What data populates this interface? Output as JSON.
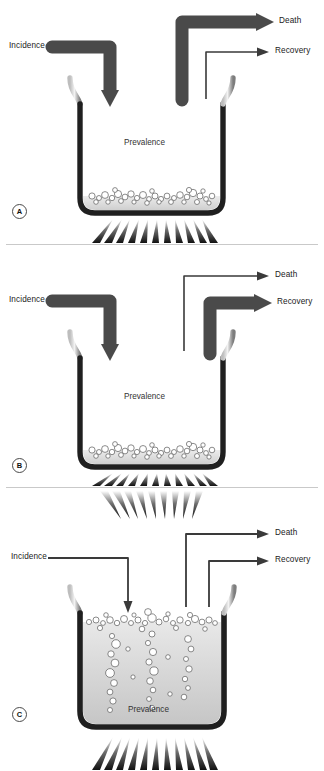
{
  "figure": {
    "type": "diagram",
    "colors": {
      "thick_arrow": "#4a4a4a",
      "thin_arrow": "#3a3a3a",
      "vessel_rim_dark": "#1f1f1f",
      "vessel_rim_light": "#d6d6d6",
      "liquid": "#d9d9d9",
      "bubble_stroke": "#555555",
      "flame": "#1a1a1a",
      "text": "#222222",
      "divider": "#c9c9c9"
    }
  },
  "panels": [
    {
      "id": "A",
      "badge": "A",
      "incidence_label": "Incidence",
      "death_label": "Death",
      "recovery_label": "Recovery",
      "prevalence_label": "Prevalence",
      "incidence_arrow_weight": "thick",
      "death_arrow_weight": "thick",
      "recovery_arrow_weight": "thin",
      "fill_level": "low",
      "fill_percent": 12,
      "bubble_count": 34,
      "flame_count": 11
    },
    {
      "id": "B",
      "badge": "B",
      "incidence_label": "Incidence",
      "death_label": "Death",
      "recovery_label": "Recovery",
      "prevalence_label": "Prevalence",
      "incidence_arrow_weight": "thick",
      "death_arrow_weight": "thin",
      "recovery_arrow_weight": "thick",
      "fill_level": "low",
      "fill_percent": 12,
      "bubble_count": 34,
      "flame_count": 11
    },
    {
      "id": "C",
      "badge": "C",
      "incidence_label": "Incidence",
      "death_label": "Death",
      "recovery_label": "Recovery",
      "prevalence_label": "Prevalence",
      "incidence_arrow_weight": "thin",
      "death_arrow_weight": "thin",
      "recovery_arrow_weight": "thin",
      "fill_level": "high",
      "fill_percent": 88,
      "bubble_count": 58,
      "flame_count": 11
    }
  ]
}
